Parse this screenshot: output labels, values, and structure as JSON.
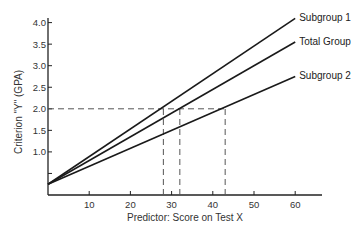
{
  "chart_data": {
    "type": "line",
    "title": "",
    "xlabel": "Predictor:  Score on Test X",
    "ylabel": "Criterion \"Y\" (GPA)",
    "xlim": [
      0,
      66
    ],
    "ylim": [
      0,
      4.2
    ],
    "grid": false,
    "legend_position": "direct labels at right end of lines",
    "x_ticks": [
      10,
      20,
      30,
      40,
      50,
      60
    ],
    "x_tick_labels": [
      "10",
      "20",
      "30",
      "40",
      "50",
      "60"
    ],
    "y_ticks": [
      0.5,
      1.0,
      1.5,
      2.0,
      2.5,
      3.0,
      3.5,
      4.0
    ],
    "y_tick_labels": [
      "",
      "1.0",
      "1.5",
      "2.0",
      "2.5",
      "3.0",
      "3.5",
      "4.0"
    ],
    "series": [
      {
        "name": "Subgroup 1",
        "x": [
          0,
          60
        ],
        "values": [
          0.25,
          4.1
        ]
      },
      {
        "name": "Total Group",
        "x": [
          0,
          60
        ],
        "values": [
          0.25,
          3.55
        ]
      },
      {
        "name": "Subgroup 2",
        "x": [
          0,
          60
        ],
        "values": [
          0.25,
          2.75
        ]
      }
    ],
    "annotations": [
      {
        "type": "dashed-horizontal",
        "y": 2.0,
        "x_from": 0,
        "x_to": 43
      },
      {
        "type": "dashed-vertical",
        "x": 28,
        "y_from": 0,
        "y_to": 2.0,
        "series": "Subgroup 1"
      },
      {
        "type": "dashed-vertical",
        "x": 32,
        "y_from": 0,
        "y_to": 2.0,
        "series": "Total Group"
      },
      {
        "type": "dashed-vertical",
        "x": 43,
        "y_from": 0,
        "y_to": 2.0,
        "series": "Subgroup 2"
      }
    ]
  },
  "colors": {
    "line": "#1a1a1a",
    "axis": "#222222",
    "dashed": "#555555",
    "background": "#ffffff"
  },
  "layout": {
    "origin_px": [
      48,
      195
    ],
    "x_px_per_unit": 4.12,
    "y_px_per_unit": 43.1,
    "x_axis_end_px": 322,
    "y_axis_top_px": 18
  }
}
